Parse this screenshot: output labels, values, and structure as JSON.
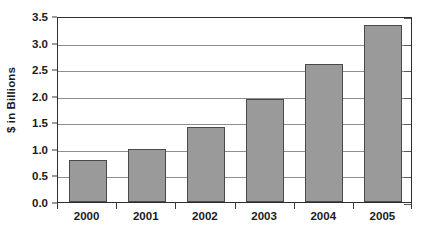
{
  "chart_data": {
    "type": "bar",
    "title": "",
    "subtitle": "",
    "xlabel": "",
    "ylabel": "$ in Billions",
    "categories": [
      "2000",
      "2001",
      "2002",
      "2003",
      "2004",
      "2005"
    ],
    "values": [
      0.8,
      1.0,
      1.42,
      1.93,
      2.6,
      3.33
    ],
    "ylim": [
      0.0,
      3.5
    ],
    "ytick_labels": [
      "0.0",
      "0.5",
      "1.0",
      "1.5",
      "2.0",
      "2.5",
      "3.0",
      "3.5"
    ],
    "ytick_values": [
      0.0,
      0.5,
      1.0,
      1.5,
      2.0,
      2.5,
      3.0,
      3.5
    ],
    "grid": true,
    "grid_axis": "y",
    "legend": false,
    "legend_position": "none",
    "bar_color": "#9a9a9a",
    "bar_border_color": "#4a4a4a",
    "gridline_color": "#8e8e8e",
    "axis_color": "#2e2e2e",
    "background_color": "#ffffff",
    "text_color": "#1a1a1a"
  }
}
